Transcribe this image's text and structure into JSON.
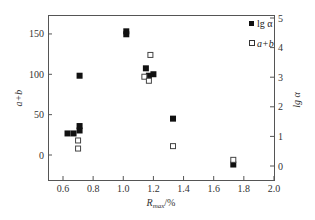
{
  "chart_data": {
    "type": "scatter",
    "title": "",
    "xlabel": "R_max/%",
    "xlabel_main": "R",
    "xlabel_sub": "max",
    "xlabel_unit": "/%",
    "ylabel_left": "a+b",
    "ylabel_right": "lg α",
    "xlim": [
      0.5,
      2.0
    ],
    "ylim_left": [
      -28,
      174
    ],
    "ylim_right": [
      -0.5,
      5
    ],
    "x_ticks": [
      "0.6",
      "0.8",
      "1.0",
      "1.2",
      "1.4",
      "1.6",
      "1.8",
      "2.0"
    ],
    "y_left_ticks": [
      "0",
      "50",
      "100",
      "150"
    ],
    "y_right_ticks": [
      "0",
      "1",
      "2",
      "3",
      "4",
      "5"
    ],
    "grid": false,
    "legend_position": "upper right",
    "series": [
      {
        "name": "lg α",
        "marker": "filled-square",
        "axis": "right",
        "x": [
          0.63,
          0.67,
          0.71,
          0.71,
          0.71,
          1.02,
          1.02,
          1.15,
          1.17,
          1.2,
          1.33,
          1.73
        ],
        "y": [
          1.1,
          1.1,
          1.2,
          1.35,
          3.05,
          4.45,
          4.55,
          3.3,
          3.05,
          3.1,
          1.6,
          0.05
        ]
      },
      {
        "name": "a+b",
        "marker": "open-square",
        "axis": "left",
        "x": [
          0.7,
          0.7,
          1.14,
          1.17,
          1.18,
          1.33,
          1.73
        ],
        "y": [
          18,
          8,
          97,
          92,
          124,
          11,
          -6
        ]
      }
    ]
  },
  "legend": {
    "filled_label": "lg α",
    "open_label": "a+b"
  }
}
